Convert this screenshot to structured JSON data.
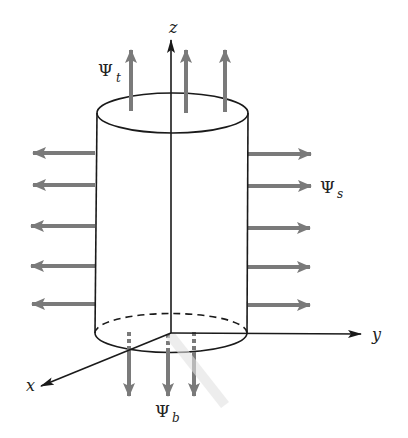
{
  "diagram": {
    "type": "cylinder-flux-diagram",
    "axes": {
      "z": "z",
      "y": "y",
      "x": "x"
    },
    "flux_labels": {
      "top": {
        "symbol": "Ψ",
        "subscript": "t"
      },
      "side": {
        "symbol": "Ψ",
        "subscript": "s"
      },
      "bottom": {
        "symbol": "Ψ",
        "subscript": "b"
      }
    },
    "arrow_counts": {
      "top": 3,
      "left_side": 5,
      "right_side": 5,
      "bottom": 3
    },
    "colors": {
      "outline": "#1a1a1a",
      "arrows": "#7a7a7a",
      "background": "#ffffff"
    }
  }
}
